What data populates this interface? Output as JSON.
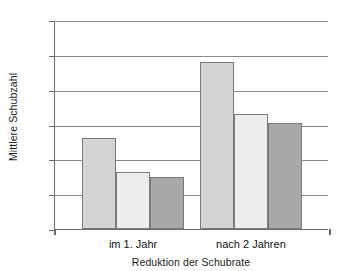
{
  "chart_data": {
    "type": "bar",
    "title": "",
    "xlabel": "Reduktion der Schubrate",
    "ylabel": "Mittlere Schubzahl",
    "categories": [
      "im 1. Jahr",
      "nach 2 Jahren"
    ],
    "ylim": [
      0,
      3.0
    ],
    "ytick_labels": [
      "0",
      "0,5",
      "1,0",
      "1,5",
      "2,0",
      "2,5",
      "3,0"
    ],
    "ytick_values": [
      0,
      0.5,
      1.0,
      1.5,
      2.0,
      2.5,
      3.0
    ],
    "grid": true,
    "legend": "none",
    "series": [
      {
        "name": "Serie 1",
        "color": "#d4d4d4",
        "values": [
          1.31,
          2.4
        ]
      },
      {
        "name": "Serie 2",
        "color": "#ededed",
        "values": [
          0.82,
          1.65
        ]
      },
      {
        "name": "Serie 3",
        "color": "#a8a8a8",
        "values": [
          0.75,
          1.52
        ]
      }
    ]
  }
}
